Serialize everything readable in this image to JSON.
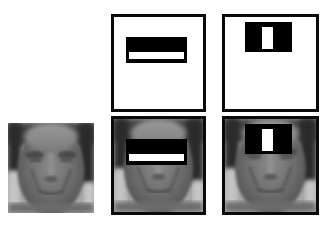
{
  "figure": {
    "title": "Haar-like features overlaid on a face image",
    "layout": {
      "rows": 2,
      "columns": 3
    },
    "panels": [
      {
        "id": "face-original",
        "row": 2,
        "col": 1,
        "content": "grayscale face image",
        "bordered": false
      },
      {
        "id": "feature-two-rect-horizontal",
        "row": 1,
        "col": 2,
        "content": "two-rectangle feature (black above white)",
        "bordered": true
      },
      {
        "id": "feature-three-rect-vertical",
        "row": 1,
        "col": 3,
        "content": "three-rectangle feature (white center between black)",
        "bordered": true
      },
      {
        "id": "face-with-two-rect",
        "row": 2,
        "col": 2,
        "content": "face with two-rectangle feature over eyes",
        "bordered": true
      },
      {
        "id": "face-with-three-rect",
        "row": 2,
        "col": 3,
        "content": "face with three-rectangle feature over nose bridge",
        "bordered": true
      }
    ]
  },
  "colors": {
    "border": "#0a0a0a",
    "feature_black": "#000000",
    "feature_white": "#ffffff",
    "background": "#ffffff",
    "face_dark": "#2e2e2e",
    "face_mid": "#7a7a7a",
    "face_light": "#b4b4b4"
  }
}
